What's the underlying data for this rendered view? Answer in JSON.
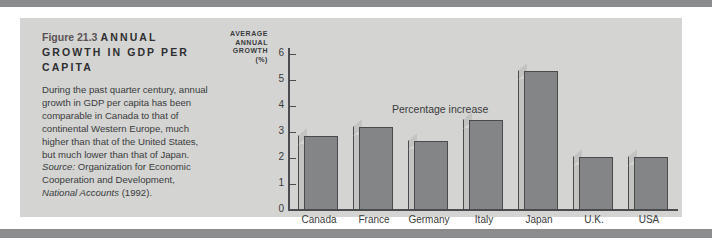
{
  "figure": {
    "number_label": "Figure 21.3",
    "headline": "ANNUAL GROWTH IN GDP PER CAPITA",
    "body": "During the past quarter century, annual growth in GDP per capita has been comparable in Canada to that of continental Western Europe, much higher than that of the United States, but much lower than that of Japan. ",
    "source_word": "Source:",
    "source_rest": " Organization for Economic Cooperation and Development, ",
    "source_italic": "National Accounts",
    "source_tail": " (1992)."
  },
  "chart_data": {
    "type": "bar",
    "title": "ANNUAL GROWTH IN GDP PER CAPITA",
    "axis_caption_lines": [
      "AVERAGE",
      "ANNUAL",
      "GROWTH",
      "(%)"
    ],
    "annotation": "Percentage increase",
    "categories": [
      "Canada",
      "France",
      "Germany",
      "Italy",
      "Japan",
      "U.K.",
      "USA"
    ],
    "values": [
      2.85,
      3.2,
      2.65,
      3.45,
      5.35,
      2.05,
      2.05
    ],
    "xlabel": "",
    "ylabel": "AVERAGE ANNUAL GROWTH (%)",
    "ylim": [
      0,
      6
    ],
    "yticks": [
      0,
      1,
      2,
      3,
      4,
      5,
      6
    ],
    "ytick_labels": [
      "0",
      "1",
      "2",
      "3",
      "4",
      "5",
      "6"
    ],
    "grid": false,
    "legend": "none",
    "bar_color": "#848586",
    "bar_side_color": "#c3c4c2",
    "bar_edge_color": "#4a4a4c"
  },
  "palette": {
    "panel_bg": "#d4d5d3",
    "rule": "#8a8c8e",
    "text": "#3a3a3c",
    "page_bg": "#ffffff"
  }
}
